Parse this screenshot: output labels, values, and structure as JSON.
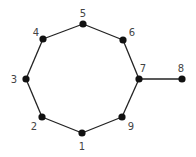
{
  "graph": {
    "nodes": [
      {
        "id": "1",
        "label": "1",
        "x": 82,
        "y": 133,
        "lx": 82,
        "ly": 150
      },
      {
        "id": "2",
        "label": "2",
        "x": 42,
        "y": 117,
        "lx": 34,
        "ly": 130
      },
      {
        "id": "3",
        "label": "3",
        "x": 26,
        "y": 79,
        "lx": 14,
        "ly": 83
      },
      {
        "id": "4",
        "label": "4",
        "x": 43,
        "y": 39,
        "lx": 36,
        "ly": 36
      },
      {
        "id": "5",
        "label": "5",
        "x": 83,
        "y": 24,
        "lx": 83,
        "ly": 17
      },
      {
        "id": "6",
        "label": "6",
        "x": 123,
        "y": 40,
        "lx": 132,
        "ly": 36
      },
      {
        "id": "7",
        "label": "7",
        "x": 139,
        "y": 79,
        "lx": 143,
        "ly": 72
      },
      {
        "id": "8",
        "label": "8",
        "x": 182,
        "y": 79,
        "lx": 181,
        "ly": 72
      },
      {
        "id": "9",
        "label": "9",
        "x": 122,
        "y": 117,
        "lx": 131,
        "ly": 130
      }
    ],
    "edges": [
      [
        "1",
        "2"
      ],
      [
        "2",
        "3"
      ],
      [
        "3",
        "4"
      ],
      [
        "4",
        "5"
      ],
      [
        "5",
        "6"
      ],
      [
        "6",
        "7"
      ],
      [
        "7",
        "9"
      ],
      [
        "9",
        "1"
      ],
      [
        "7",
        "8"
      ]
    ],
    "colors": {
      "node": "#111111",
      "edge": "#222222",
      "label": "#444444"
    }
  }
}
